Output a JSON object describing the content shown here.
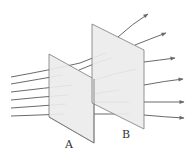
{
  "diagram": {
    "type": "field-lines-through-surfaces",
    "labels": {
      "plane_a": "A",
      "plane_b": "B"
    },
    "colors": {
      "background": "#ffffff",
      "plane_fill": "#ececec",
      "plane_edge": "#7a7a7a",
      "field_line": "#6a6a6a",
      "label": "#333333"
    },
    "planes": [
      {
        "id": "A",
        "points": "49,54 94,79 94,143 49,117",
        "label_pos": [
          68,
          147
        ]
      },
      {
        "id": "B",
        "points": "92,24 144,50 144,129 92,103",
        "label_pos": [
          124,
          137
        ]
      }
    ],
    "field_line_count": 6,
    "arrowheads": 6
  }
}
